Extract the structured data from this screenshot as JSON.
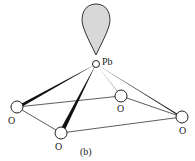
{
  "diagram": {
    "caption": "(b)",
    "central_atom": {
      "label": "Pb",
      "x": 96,
      "y": 64
    },
    "lone_pair": {
      "fill": "#d8d8d8",
      "stroke": "#333333"
    },
    "atoms": [
      {
        "label": "O",
        "x": 17,
        "y": 107
      },
      {
        "label": "O",
        "x": 61,
        "y": 133
      },
      {
        "label": "O",
        "x": 121,
        "y": 96
      },
      {
        "label": "O",
        "x": 182,
        "y": 117
      }
    ]
  }
}
